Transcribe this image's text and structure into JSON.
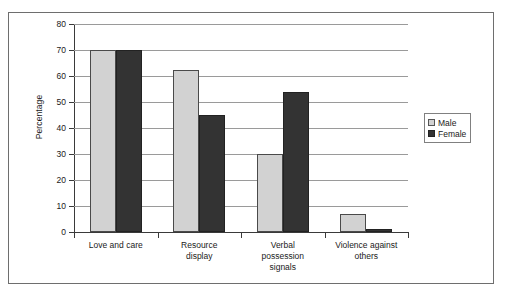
{
  "chart_data": {
    "type": "bar",
    "title": "",
    "xlabel": "",
    "ylabel": "Percentage",
    "ylim": [
      0,
      80
    ],
    "ytick_step": 10,
    "yticks": [
      "80",
      "70",
      "60",
      "50",
      "40",
      "30",
      "20",
      "10",
      "0"
    ],
    "grid": true,
    "legend_position": "right",
    "categories": [
      "Love and care",
      "Resource display",
      "Verbal possession signals",
      "Violence against others"
    ],
    "category_lines": [
      [
        "Love and care"
      ],
      [
        "Resource",
        "display"
      ],
      [
        "Verbal",
        "possession",
        "signals"
      ],
      [
        "Violence against",
        "others"
      ]
    ],
    "series": [
      {
        "name": "Male",
        "color": "#d2d2d2",
        "values": [
          70,
          62.5,
          30,
          7
        ]
      },
      {
        "name": "Female",
        "color": "#333333",
        "values": [
          70,
          45,
          54,
          1
        ]
      }
    ]
  },
  "legend": {
    "items": [
      {
        "label": "Male",
        "swatch": "male"
      },
      {
        "label": "Female",
        "swatch": "female"
      }
    ]
  }
}
